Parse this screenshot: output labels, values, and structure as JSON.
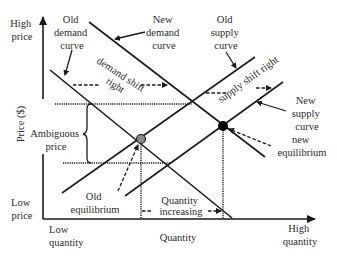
{
  "diagram": {
    "axes": {
      "y_label": "Price ($)",
      "y_high": [
        "High",
        "price"
      ],
      "y_low": [
        "Low",
        "price"
      ],
      "x_label": "Quantity",
      "x_low": [
        "Low",
        "quantity"
      ],
      "x_high": [
        "High",
        "quantity"
      ]
    },
    "labels": {
      "old_demand": [
        "Old",
        "demand",
        "curve"
      ],
      "new_demand": [
        "New",
        "demand",
        "curve"
      ],
      "old_supply": [
        "Old",
        "supply",
        "curve"
      ],
      "new_supply": [
        "New",
        "supply",
        "curve"
      ],
      "demand_shift": [
        "demand shift",
        "right"
      ],
      "supply_shift": "supply shift right",
      "ambiguous_price": [
        "Ambiguous",
        "price"
      ],
      "old_equilibrium": [
        "Old",
        "equilibrium"
      ],
      "new_equilibrium": [
        "new",
        "equilibrium"
      ],
      "quantity_increasing": [
        "Quantity",
        "increasing"
      ]
    },
    "colors": {
      "line": "#1a1a1a",
      "old_equilibrium_dot": "#8a8a8a",
      "new_equilibrium_dot": "#000000"
    },
    "curves": [
      {
        "name": "Old demand curve",
        "from": [
          50,
          70
        ],
        "to": [
          232,
          218
        ]
      },
      {
        "name": "New demand curve",
        "from": [
          89,
          22
        ],
        "to": [
          265,
          157
        ]
      },
      {
        "name": "Old supply curve",
        "from": [
          62,
          193
        ],
        "to": [
          255,
          57
        ]
      },
      {
        "name": "New supply curve",
        "from": [
          125,
          196
        ],
        "to": [
          283,
          82
        ]
      }
    ]
  }
}
